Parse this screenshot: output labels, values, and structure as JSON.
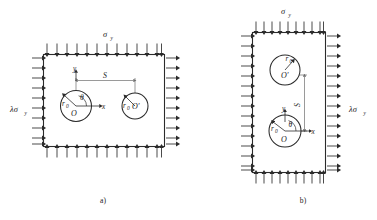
{
  "figure": {
    "background_color": "#ffffff",
    "line_color": "#2b2b2b",
    "guide_color": "#6f6f6f",
    "panels": [
      {
        "id": "panel-a",
        "caption": "a)",
        "orientation": "horizontal",
        "top_load_label": "σ",
        "top_load_subscript": "y",
        "side_load_label": "λσ",
        "side_load_subscript": "y",
        "side_load_position": "left",
        "distance_label": "S",
        "distance_direction": "horizontal",
        "axis_x_label": "x",
        "axis_y_label": "y",
        "angle_label": "θ",
        "holes": [
          {
            "center_label": "O",
            "radius_label": "r",
            "radius_subscript": "0",
            "role": "origin-hole"
          },
          {
            "center_label": "O′",
            "radius_label": "r",
            "radius_subscript": "0",
            "role": "second-hole"
          }
        ]
      },
      {
        "id": "panel-b",
        "caption": "b)",
        "orientation": "vertical",
        "top_load_label": "σ",
        "top_load_subscript": "y",
        "side_load_label": "λσ",
        "side_load_subscript": "y",
        "side_load_position": "right",
        "distance_label": "S",
        "distance_direction": "vertical",
        "axis_x_label": "x",
        "axis_y_label": "y",
        "angle_label": "θ",
        "holes": [
          {
            "center_label": "O′",
            "radius_label": "r",
            "radius_subscript": "0",
            "role": "second-hole"
          },
          {
            "center_label": "O",
            "radius_label": "r",
            "radius_subscript": "0",
            "role": "origin-hole"
          }
        ]
      }
    ]
  }
}
